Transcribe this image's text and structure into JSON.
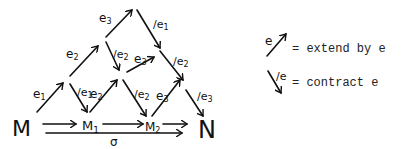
{
  "diagram": {
    "nodes": {
      "M": "M",
      "M1": "M",
      "M1_sub": "1",
      "M2": "M",
      "M2_sub": "2",
      "N": "N"
    },
    "bottom_arrow_label": "σ",
    "edge_labels": {
      "e1_up": "e",
      "e1_up_sub": "1",
      "e2_up": "e",
      "e2_up_sub": "2",
      "e3_up": "e",
      "e3_up_sub": "3",
      "c1_down": "/e",
      "c1_down_sub": "1",
      "c2_down": "/e",
      "c2_down_sub": "2",
      "c1_mid": "/e",
      "c1_mid_sub": "1",
      "e2_mid": "e",
      "e2_mid_sub": "2",
      "e3_mid": "e",
      "e3_mid_sub": "3",
      "c2_mid": "/e",
      "c2_mid_sub": "2",
      "c2_low": "/e",
      "c2_low_sub": "2",
      "e3_low": "e",
      "e3_low_sub": "3",
      "c3_low": "/e",
      "c3_low_sub": "3",
      "c3_right": "/e",
      "c3_right_sub": "3"
    }
  },
  "legend": {
    "extend_symbol_label": "e",
    "extend_text": "= extend by e",
    "contract_symbol_label": "/e",
    "contract_text": "= contract e"
  }
}
